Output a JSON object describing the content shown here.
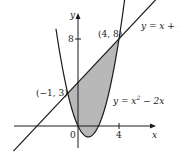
{
  "chart_data": {
    "type": "line",
    "title": "",
    "xlabel": "x",
    "ylabel": "y",
    "x_ticks": [
      {
        "value": 0,
        "label": "0"
      },
      {
        "value": 4,
        "label": "4"
      }
    ],
    "y_ticks": [
      {
        "value": 8,
        "label": "8"
      }
    ],
    "xlim": [
      -7.5,
      9.5
    ],
    "ylim": [
      -3,
      10.5
    ],
    "grid": false,
    "legend": "none",
    "series": [
      {
        "name": "y = x + 4",
        "kind": "line",
        "equation": "y = x + 4",
        "x": [
          -7.5,
          8.5
        ],
        "y": [
          -3.5,
          12.5
        ]
      },
      {
        "name": "y = x² − 2x",
        "kind": "parabola",
        "equation": "y = x^2 - 2x",
        "x": [
          -2,
          -1,
          0,
          1,
          2,
          3,
          4,
          4.6
        ],
        "y": [
          8,
          3,
          0,
          -1,
          0,
          3,
          8,
          11.96
        ]
      }
    ],
    "shaded_region": {
      "between": [
        "y = x + 4",
        "y = x² − 2x"
      ],
      "x_range": [
        -1,
        4
      ],
      "color": "#b8b8b8"
    },
    "annotations": [
      {
        "text": "(−1, 3)",
        "x": -1,
        "y": 3
      },
      {
        "text": "(4, 8)",
        "x": 4,
        "y": 8
      },
      {
        "text": "y = x + 4",
        "attached_to": "line"
      },
      {
        "text": "y = x² − 2x",
        "attached_to": "parabola"
      }
    ]
  },
  "labels": {
    "axis_x": "x",
    "axis_y": "y",
    "tick_x0": "0",
    "tick_x4": "4",
    "tick_y8": "8",
    "point_left": "(−1, 3)",
    "point_right": "(4, 8)",
    "line_eq": "y = x + 4",
    "parabola_eq_prefix": "y = x",
    "parabola_eq_exp": "2",
    "parabola_eq_suffix": " − 2x"
  },
  "colors": {
    "shade": "#b8b8b8",
    "stroke": "#1a1a1a"
  }
}
